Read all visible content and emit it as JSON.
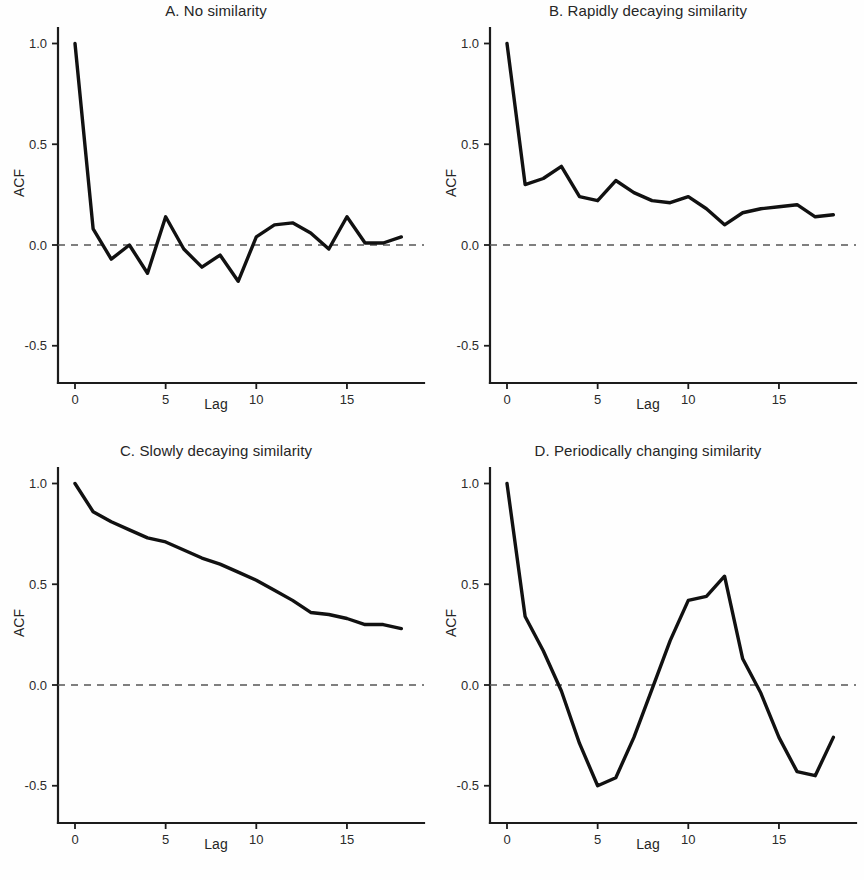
{
  "figure": {
    "background_color": "#fefefe",
    "line_color": "#111111",
    "axis_color": "#1c1c1c",
    "zero_line_color": "#555555"
  },
  "panels": [
    {
      "key": "A",
      "title": "A. No similarity",
      "xlabel": "Lag",
      "ylabel": "ACF",
      "x_ticks": [
        "0",
        "5",
        "10",
        "15"
      ],
      "y_ticks": [
        "1.0",
        "0.5",
        "0.0",
        "-0.5"
      ]
    },
    {
      "key": "B",
      "title": "B. Rapidly decaying similarity",
      "xlabel": "Lag",
      "ylabel": "ACF",
      "x_ticks": [
        "0",
        "5",
        "10",
        "15"
      ],
      "y_ticks": [
        "1.0",
        "0.5",
        "0.0",
        "-0.5"
      ]
    },
    {
      "key": "C",
      "title": "C. Slowly decaying similarity",
      "xlabel": "Lag",
      "ylabel": "ACF",
      "x_ticks": [
        "0",
        "5",
        "10",
        "15"
      ],
      "y_ticks": [
        "1.0",
        "0.5",
        "0.0",
        "-0.5"
      ]
    },
    {
      "key": "D",
      "title": "D. Periodically changing similarity",
      "xlabel": "Lag",
      "ylabel": "ACF",
      "x_ticks": [
        "0",
        "5",
        "10",
        "15"
      ],
      "y_ticks": [
        "1.0",
        "0.5",
        "0.0",
        "-0.5"
      ]
    }
  ],
  "chart_data": [
    {
      "type": "line",
      "panel": "A",
      "title": "A. No similarity",
      "xlabel": "Lag",
      "ylabel": "ACF",
      "x": [
        0,
        1,
        2,
        3,
        4,
        5,
        6,
        7,
        8,
        9,
        10,
        11,
        12,
        13,
        14,
        15,
        16,
        17,
        18
      ],
      "values": [
        1.0,
        0.08,
        -0.07,
        0.0,
        -0.14,
        0.14,
        -0.02,
        -0.11,
        -0.05,
        -0.18,
        0.04,
        0.1,
        0.11,
        0.06,
        -0.02,
        0.14,
        0.01,
        0.01,
        0.04
      ],
      "xlim": [
        -0.6,
        18.8
      ],
      "ylim": [
        -0.72,
        1.08
      ],
      "xticks": [
        0,
        5,
        10,
        15
      ],
      "yticks": [
        1.0,
        0.5,
        0.0,
        -0.5
      ],
      "grid": false,
      "legend": "none",
      "annotations": [
        "dashed reference line at ACF = 0"
      ]
    },
    {
      "type": "line",
      "panel": "B",
      "title": "B. Rapidly decaying similarity",
      "xlabel": "Lag",
      "ylabel": "ACF",
      "x": [
        0,
        1,
        2,
        3,
        4,
        5,
        6,
        7,
        8,
        9,
        10,
        11,
        12,
        13,
        14,
        15,
        16,
        17,
        18
      ],
      "values": [
        1.0,
        0.3,
        0.33,
        0.39,
        0.24,
        0.22,
        0.32,
        0.26,
        0.22,
        0.21,
        0.24,
        0.18,
        0.1,
        0.16,
        0.18,
        0.19,
        0.2,
        0.14,
        0.15
      ],
      "xlim": [
        -0.6,
        18.8
      ],
      "ylim": [
        -0.72,
        1.08
      ],
      "xticks": [
        0,
        5,
        10,
        15
      ],
      "yticks": [
        1.0,
        0.5,
        0.0,
        -0.5
      ],
      "grid": false,
      "legend": "none",
      "annotations": [
        "dashed reference line at ACF = 0"
      ]
    },
    {
      "type": "line",
      "panel": "C",
      "title": "C. Slowly decaying similarity",
      "xlabel": "Lag",
      "ylabel": "ACF",
      "x": [
        0,
        1,
        2,
        3,
        4,
        5,
        6,
        7,
        8,
        9,
        10,
        11,
        12,
        13,
        14,
        15,
        16,
        17,
        18
      ],
      "values": [
        1.0,
        0.86,
        0.81,
        0.77,
        0.73,
        0.71,
        0.67,
        0.63,
        0.6,
        0.56,
        0.52,
        0.47,
        0.42,
        0.36,
        0.35,
        0.33,
        0.3,
        0.3,
        0.28
      ],
      "xlim": [
        -0.6,
        18.8
      ],
      "ylim": [
        -0.72,
        1.08
      ],
      "xticks": [
        0,
        5,
        10,
        15
      ],
      "yticks": [
        1.0,
        0.5,
        0.0,
        -0.5
      ],
      "grid": false,
      "legend": "none",
      "annotations": [
        "dashed reference line at ACF = 0"
      ]
    },
    {
      "type": "line",
      "panel": "D",
      "title": "D. Periodically changing similarity",
      "xlabel": "Lag",
      "ylabel": "ACF",
      "x": [
        0,
        1,
        2,
        3,
        4,
        5,
        6,
        7,
        8,
        9,
        10,
        11,
        12,
        13,
        14,
        15,
        16,
        17,
        18
      ],
      "values": [
        1.0,
        0.34,
        0.17,
        -0.03,
        -0.29,
        -0.5,
        -0.46,
        -0.26,
        -0.02,
        0.22,
        0.42,
        0.44,
        0.54,
        0.13,
        -0.04,
        -0.26,
        -0.43,
        -0.45,
        -0.26
      ],
      "xlim": [
        -0.6,
        18.8
      ],
      "ylim": [
        -0.72,
        1.08
      ],
      "xticks": [
        0,
        5,
        10,
        15
      ],
      "yticks": [
        1.0,
        0.5,
        0.0,
        -0.5
      ],
      "grid": false,
      "legend": "none",
      "annotations": [
        "dashed reference line at ACF = 0"
      ]
    }
  ]
}
